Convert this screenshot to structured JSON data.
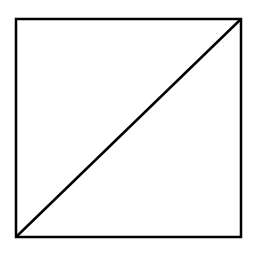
{
  "diagram": {
    "shape": "square-with-diagonal",
    "background": "#ffffff",
    "stroke_color": "#000000",
    "stroke_width": 2.5,
    "square": {
      "x": 16,
      "y": 19,
      "width": 225,
      "height": 218
    },
    "diagonal": {
      "from": "bottom-left",
      "to": "top-right",
      "x1": 16,
      "y1": 237,
      "x2": 241,
      "y2": 19
    }
  }
}
